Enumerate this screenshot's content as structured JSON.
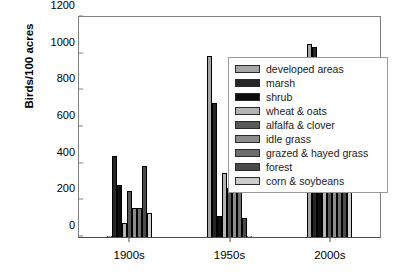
{
  "chart_data": {
    "type": "bar",
    "title": "",
    "subtitle": "",
    "xlabel": "",
    "ylabel": "Birds/100 acres",
    "categories": [
      "1900s",
      "1950s",
      "2000s"
    ],
    "ylim": [
      0,
      1200
    ],
    "yticks": [
      0,
      200,
      400,
      600,
      800,
      1000,
      1200
    ],
    "grid": false,
    "legend_position": "right-inside",
    "series": [
      {
        "name": "developed areas",
        "color": "#a6a6a6",
        "values": [
          0,
          985,
          1055
        ]
      },
      {
        "name": "marsh",
        "color": "#262626",
        "values": [
          440,
          730,
          1035
        ]
      },
      {
        "name": "shrub",
        "color": "#0d0d0d",
        "values": [
          285,
          115,
          935
        ]
      },
      {
        "name": "wheat & oats",
        "color": "#b3b3b3",
        "values": [
          75,
          350,
          695
        ]
      },
      {
        "name": "alfalfa & clover",
        "color": "#595959",
        "values": [
          250,
          265,
          510
        ]
      },
      {
        "name": "idle grass",
        "color": "#8c8c8c",
        "values": [
          160,
          295,
          490
        ]
      },
      {
        "name": "grazed & hayed grass",
        "color": "#6e6e6e",
        "values": [
          160,
          245,
          480
        ]
      },
      {
        "name": "forest",
        "color": "#4a4a4a",
        "values": [
          385,
          105,
          410
        ]
      },
      {
        "name": "corn & soybeans",
        "color": "#cccccc",
        "values": [
          130,
          0,
          320
        ]
      }
    ]
  }
}
